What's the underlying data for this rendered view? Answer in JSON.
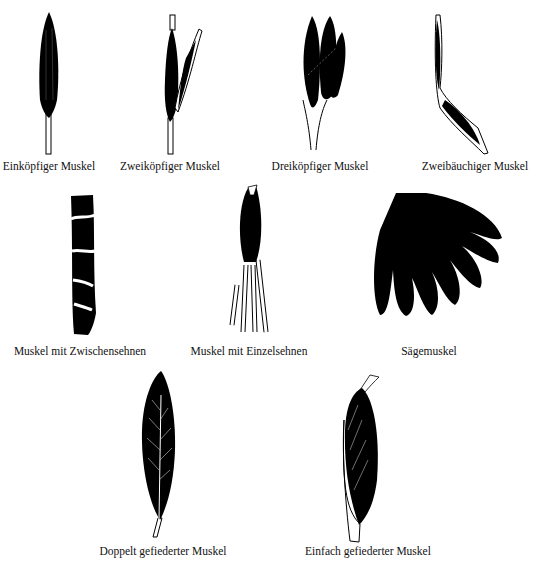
{
  "diagram": {
    "items": [
      {
        "id": "einkoepfig",
        "label": "Einköpfiger Muskel"
      },
      {
        "id": "zweikoepfig",
        "label": "Zweiköpfiger Muskel"
      },
      {
        "id": "dreikoepfig",
        "label": "Dreiköpfiger Muskel"
      },
      {
        "id": "zweibaeuchig",
        "label": "Zweibäuchiger Muskel"
      },
      {
        "id": "zwischensehnen",
        "label": "Muskel mit Zwischensehnen"
      },
      {
        "id": "einzelsehnen",
        "label": "Muskel mit Einzelsehnen"
      },
      {
        "id": "saegemuskel",
        "label": "Sägemuskel"
      },
      {
        "id": "doppelt-gefiedert",
        "label": "Doppelt gefiederter Muskel"
      },
      {
        "id": "einfach-gefiedert",
        "label": "Einfach gefiederter Muskel"
      }
    ],
    "colors": {
      "muscle": "#000000",
      "tendon": "#ffffff",
      "background": "#ffffff"
    }
  }
}
